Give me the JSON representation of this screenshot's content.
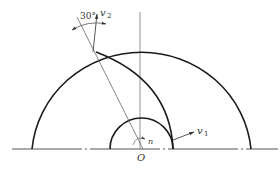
{
  "diagram": {
    "title": "",
    "type": "impeller-velocity-sketch",
    "labels": {
      "origin": "O",
      "rotation": "n",
      "outlet_velocity": {
        "symbol": "v",
        "subscript": "2"
      },
      "inlet_velocity": {
        "symbol": "v",
        "subscript": "1"
      },
      "angle": "30°"
    },
    "colors": {
      "stroke_main": "#1a1a1a",
      "stroke_thin": "#555555",
      "background": "#ffffff"
    }
  }
}
